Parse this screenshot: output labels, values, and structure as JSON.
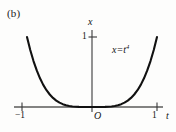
{
  "figure": {
    "panel_label": "(b)",
    "background_color": "#fdfdfc",
    "curve_color": "#111111",
    "axis_color": "#555555"
  },
  "chart_data": {
    "type": "line",
    "title": "",
    "subtitle": "",
    "panel": "(b)",
    "equation_label": "x=t",
    "equation_exponent": "4",
    "xlabel": "t",
    "ylabel": "x",
    "xlim": [
      -1,
      1
    ],
    "ylim": [
      0,
      1
    ],
    "xticks": [
      -1,
      1
    ],
    "xtick_labels": [
      "−1",
      "1"
    ],
    "yticks": [
      1
    ],
    "ytick_labels": [
      "1"
    ],
    "origin_label": "O",
    "grid": false,
    "legend": false,
    "x": [
      -1.0,
      -0.95,
      -0.9,
      -0.85,
      -0.8,
      -0.75,
      -0.7,
      -0.65,
      -0.6,
      -0.55,
      -0.5,
      -0.45,
      -0.4,
      -0.35,
      -0.3,
      -0.25,
      -0.2,
      -0.15,
      -0.1,
      -0.05,
      0.0,
      0.05,
      0.1,
      0.15,
      0.2,
      0.25,
      0.3,
      0.35,
      0.4,
      0.45,
      0.5,
      0.55,
      0.6,
      0.65,
      0.7,
      0.75,
      0.8,
      0.85,
      0.9,
      0.95,
      1.0
    ],
    "values": [
      1.0,
      0.8145,
      0.6561,
      0.522,
      0.4096,
      0.3164,
      0.2401,
      0.1785,
      0.1296,
      0.0915,
      0.0625,
      0.041,
      0.0256,
      0.015,
      0.0081,
      0.0039,
      0.0016,
      0.0005,
      0.0001,
      0.0,
      0.0,
      0.0,
      0.0001,
      0.0005,
      0.0016,
      0.0039,
      0.0081,
      0.015,
      0.0256,
      0.041,
      0.0625,
      0.0915,
      0.1296,
      0.1785,
      0.2401,
      0.3164,
      0.4096,
      0.522,
      0.6561,
      0.8145,
      1.0
    ],
    "series": [
      {
        "name": "x=t^4",
        "values": [
          1.0,
          0.8145,
          0.6561,
          0.522,
          0.4096,
          0.3164,
          0.2401,
          0.1785,
          0.1296,
          0.0915,
          0.0625,
          0.041,
          0.0256,
          0.015,
          0.0081,
          0.0039,
          0.0016,
          0.0005,
          0.0001,
          0.0,
          0.0,
          0.0,
          0.0001,
          0.0005,
          0.0016,
          0.0039,
          0.0081,
          0.015,
          0.0256,
          0.041,
          0.0625,
          0.0915,
          0.1296,
          0.1785,
          0.2401,
          0.3164,
          0.4096,
          0.522,
          0.6561,
          0.8145,
          1.0
        ]
      }
    ]
  }
}
